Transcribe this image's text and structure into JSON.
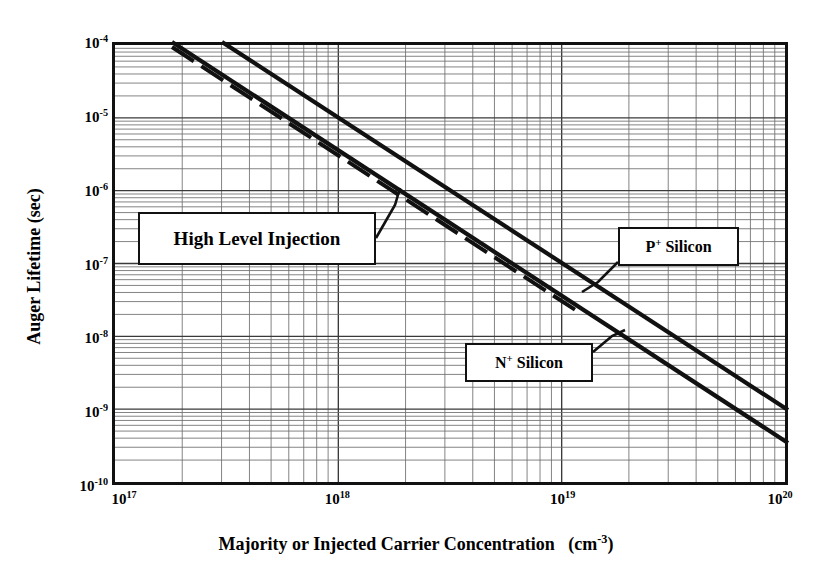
{
  "chart_data": {
    "type": "line",
    "title": "",
    "xlabel": "Majority or Injected Carrier Concentration   (cm-3)",
    "xlabel_main": "Majority or Injected Carrier Concentration",
    "xlabel_unit_base": "(cm",
    "xlabel_unit_sup": "-3",
    "xlabel_unit_close": ")",
    "ylabel": "Auger Lifetime  (sec)",
    "xscale": "log",
    "yscale": "log",
    "xlim": [
      1e+17,
      1e+20
    ],
    "ylim": [
      1e-10,
      0.0001
    ],
    "grid": "log-log minor gridlines, on",
    "legend": "inline callout boxes",
    "x_ticks": [
      {
        "value": 1e+17,
        "mantissa": "10",
        "exponent": "17"
      },
      {
        "value": 1e+18,
        "mantissa": "10",
        "exponent": "18"
      },
      {
        "value": 1e+19,
        "mantissa": "10",
        "exponent": "19"
      },
      {
        "value": 1e+20,
        "mantissa": "10",
        "exponent": "20"
      }
    ],
    "y_ticks": [
      {
        "value": 0.0001,
        "mantissa": "10",
        "exponent": "-4"
      },
      {
        "value": 1e-05,
        "mantissa": "10",
        "exponent": "-5"
      },
      {
        "value": 1e-06,
        "mantissa": "10",
        "exponent": "-6"
      },
      {
        "value": 1e-07,
        "mantissa": "10",
        "exponent": "-7"
      },
      {
        "value": 1e-08,
        "mantissa": "10",
        "exponent": "-8"
      },
      {
        "value": 1e-09,
        "mantissa": "10",
        "exponent": "-9"
      },
      {
        "value": 1e-10,
        "mantissa": "10",
        "exponent": "-10"
      }
    ],
    "series": [
      {
        "name": "P+ Silicon",
        "style": "solid",
        "label_main": "P",
        "label_sup": "+",
        "label_rest": " Silicon",
        "slope_decades": -1.79,
        "x": [
          3.1e+17,
          1e+18,
          1e+19,
          1e+20
        ],
        "y": [
          0.0001,
          1.46e-05,
          2.36e-07,
          1.03e-09
        ]
      },
      {
        "name": "N+ Silicon",
        "style": "solid",
        "label_main": "N",
        "label_sup": "+",
        "label_rest": " Silicon",
        "slope_decades": -1.79,
        "x": [
          1.86e+17,
          1e+18,
          1e+19,
          1e+20
        ],
        "y": [
          0.0001,
          7e-06,
          1.12e-07,
          3.9e-10
        ]
      },
      {
        "name": "High Level Injection",
        "style": "dashed",
        "label_main": "High Level Injection",
        "slope_decades": -1.79,
        "x": [
          1.86e+17,
          1e+18,
          1e+19
        ],
        "y": [
          0.0001,
          7e-06,
          1.12e-07
        ]
      }
    ],
    "annotations": [
      {
        "text": "High Level Injection",
        "points_to": "dashed curve"
      },
      {
        "text": "P+ Silicon",
        "points_to": "upper solid curve"
      },
      {
        "text": "N+ Silicon",
        "points_to": "lower solid curve"
      }
    ]
  }
}
